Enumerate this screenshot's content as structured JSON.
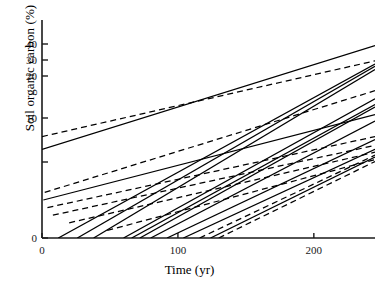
{
  "chart_data": {
    "type": "line",
    "title": "",
    "xlabel": "Time (yr)",
    "ylabel": "Soil organic carbon (%)",
    "xlim": [
      0,
      245
    ],
    "xticks": [
      0,
      100,
      200
    ],
    "xticklabels": [
      "0",
      "100",
      "200"
    ],
    "ylim": [
      0,
      45
    ],
    "yticks": [
      0,
      1,
      10,
      20,
      30,
      40
    ],
    "yticklabels": [
      "0",
      "",
      "10",
      "20",
      "30",
      "40"
    ],
    "grid": false,
    "legend": null,
    "y_scale_note": "compressed upper scale (log-like): 0,1,10,20,30,40 unevenly spaced",
    "series": [
      {
        "name": "line-01",
        "style": "solid",
        "x": [
          0,
          245
        ],
        "y": [
          3.6,
          39.0
        ]
      },
      {
        "name": "line-02",
        "style": "dashed",
        "x": [
          0,
          245
        ],
        "y": [
          6.2,
          29.5
        ]
      },
      {
        "name": "line-03",
        "style": "solid",
        "x": [
          12,
          245
        ],
        "y": [
          0.0,
          27.5
        ]
      },
      {
        "name": "line-04",
        "style": "solid",
        "x": [
          26,
          245
        ],
        "y": [
          0.0,
          26.0
        ]
      },
      {
        "name": "line-05",
        "style": "solid",
        "x": [
          38,
          245
        ],
        "y": [
          0.0,
          24.0
        ]
      },
      {
        "name": "line-06",
        "style": "dashed",
        "x": [
          2,
          245
        ],
        "y": [
          0.6,
          16.5
        ]
      },
      {
        "name": "line-07",
        "style": "solid",
        "x": [
          60,
          245
        ],
        "y": [
          0.0,
          14.6
        ]
      },
      {
        "name": "line-08",
        "style": "solid",
        "x": [
          66,
          245
        ],
        "y": [
          0.0,
          13.2
        ]
      },
      {
        "name": "line-09",
        "style": "solid",
        "x": [
          72,
          245
        ],
        "y": [
          0.0,
          12.6
        ]
      },
      {
        "name": "line-10",
        "style": "solid",
        "x": [
          1,
          245
        ],
        "y": [
          0.5,
          10.8
        ]
      },
      {
        "name": "line-11",
        "style": "solid",
        "x": [
          80,
          245
        ],
        "y": [
          0.0,
          9.4
        ]
      },
      {
        "name": "line-12",
        "style": "dashed",
        "x": [
          4,
          245
        ],
        "y": [
          0.4,
          6.2
        ]
      },
      {
        "name": "line-13",
        "style": "solid",
        "x": [
          92,
          245
        ],
        "y": [
          0.0,
          5.6
        ]
      },
      {
        "name": "line-14",
        "style": "dashed",
        "x": [
          8,
          245
        ],
        "y": [
          0.3,
          4.4
        ]
      },
      {
        "name": "line-15",
        "style": "solid",
        "x": [
          104,
          245
        ],
        "y": [
          0.0,
          3.6
        ]
      },
      {
        "name": "line-16",
        "style": "dashed",
        "x": [
          20,
          245
        ],
        "y": [
          0.2,
          3.0
        ]
      },
      {
        "name": "line-17",
        "style": "dashed",
        "x": [
          116,
          245
        ],
        "y": [
          0.0,
          2.4
        ]
      },
      {
        "name": "line-18",
        "style": "solid",
        "x": [
          124,
          245
        ],
        "y": [
          0.0,
          2.0
        ]
      },
      {
        "name": "line-19",
        "style": "dashed",
        "x": [
          48,
          245
        ],
        "y": [
          0.1,
          1.5
        ]
      },
      {
        "name": "line-20",
        "style": "dashed",
        "x": [
          130,
          245
        ],
        "y": [
          0.0,
          1.1
        ]
      }
    ]
  },
  "style": {
    "axis_color": "#1a1a1a",
    "line_color": "#000000"
  }
}
